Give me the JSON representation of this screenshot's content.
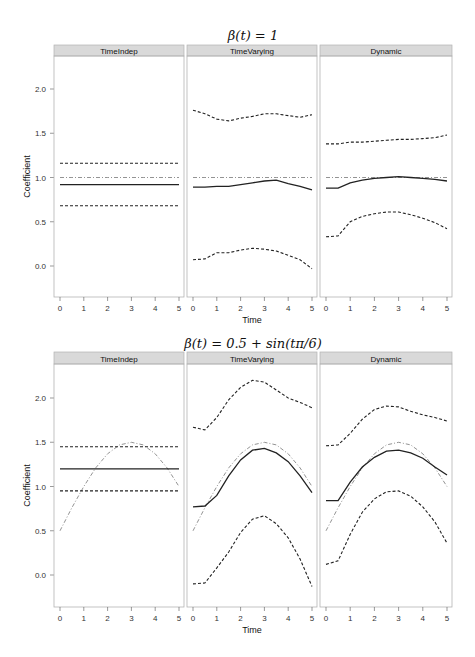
{
  "chart_data": {
    "type": "line",
    "layout": "2 rows x 3 lattice panels (trellis)",
    "xlabel": "Time",
    "ylabel": "Coefficient",
    "xlim": [
      -0.25,
      5.25
    ],
    "ylim": [
      -0.37,
      2.4
    ],
    "x_ticks": [
      0,
      1,
      2,
      3,
      4,
      5
    ],
    "y_ticks": [
      0.0,
      0.5,
      1.0,
      1.5,
      2.0
    ],
    "y_tick_labels": [
      "0.0",
      "0.5",
      "1.0",
      "1.5",
      "2.0"
    ],
    "grid": false,
    "legend": null,
    "line_styles": {
      "estimate": "solid black",
      "ci_lower": "dashed black",
      "ci_upper": "dashed black",
      "true_beta": "dot-dash gray"
    },
    "panel_names": [
      "TimeIndep",
      "TimeVarying",
      "Dynamic"
    ],
    "rows": [
      {
        "title": "β(t) = 1",
        "x": [
          0,
          0.5,
          1,
          1.5,
          2,
          2.5,
          3,
          3.5,
          4,
          4.5,
          5
        ],
        "panels": [
          {
            "name": "TimeIndep",
            "true_beta": [
              1,
              1,
              1,
              1,
              1,
              1,
              1,
              1,
              1,
              1,
              1
            ],
            "estimate": [
              0.92,
              0.92,
              0.92,
              0.92,
              0.92,
              0.92,
              0.92,
              0.92,
              0.92,
              0.92,
              0.92
            ],
            "ci_lower": [
              0.68,
              0.68,
              0.68,
              0.68,
              0.68,
              0.68,
              0.68,
              0.68,
              0.68,
              0.68,
              0.68
            ],
            "ci_upper": [
              1.16,
              1.16,
              1.16,
              1.16,
              1.16,
              1.16,
              1.16,
              1.16,
              1.16,
              1.16,
              1.16
            ]
          },
          {
            "name": "TimeVarying",
            "true_beta": [
              1,
              1,
              1,
              1,
              1,
              1,
              1,
              1,
              1,
              1,
              1
            ],
            "estimate": [
              0.89,
              0.89,
              0.9,
              0.9,
              0.92,
              0.94,
              0.96,
              0.97,
              0.93,
              0.9,
              0.86
            ],
            "ci_lower": [
              0.07,
              0.08,
              0.15,
              0.15,
              0.18,
              0.2,
              0.19,
              0.17,
              0.12,
              0.07,
              -0.03
            ],
            "ci_upper": [
              1.76,
              1.72,
              1.66,
              1.64,
              1.67,
              1.69,
              1.72,
              1.72,
              1.7,
              1.68,
              1.71
            ]
          },
          {
            "name": "Dynamic",
            "true_beta": [
              1,
              1,
              1,
              1,
              1,
              1,
              1,
              1,
              1,
              1,
              1
            ],
            "estimate": [
              0.88,
              0.88,
              0.94,
              0.97,
              0.99,
              1.0,
              1.01,
              1.0,
              0.99,
              0.98,
              0.96
            ],
            "ci_lower": [
              0.33,
              0.34,
              0.5,
              0.56,
              0.59,
              0.61,
              0.61,
              0.58,
              0.54,
              0.49,
              0.42
            ],
            "ci_upper": [
              1.38,
              1.38,
              1.4,
              1.4,
              1.41,
              1.42,
              1.43,
              1.43,
              1.44,
              1.45,
              1.48
            ]
          }
        ]
      },
      {
        "title": "β(t) = 0.5 + sin(tπ/6)",
        "x": [
          0,
          0.5,
          1,
          1.5,
          2,
          2.5,
          3,
          3.5,
          4,
          4.5,
          5
        ],
        "panels": [
          {
            "name": "TimeIndep",
            "true_beta": [
              0.5,
              0.76,
              1.0,
              1.21,
              1.37,
              1.47,
              1.5,
              1.47,
              1.37,
              1.21,
              1.0
            ],
            "estimate": [
              1.2,
              1.2,
              1.2,
              1.2,
              1.2,
              1.2,
              1.2,
              1.2,
              1.2,
              1.2,
              1.2
            ],
            "ci_lower": [
              0.95,
              0.95,
              0.95,
              0.95,
              0.95,
              0.95,
              0.95,
              0.95,
              0.95,
              0.95,
              0.95
            ],
            "ci_upper": [
              1.45,
              1.45,
              1.45,
              1.45,
              1.45,
              1.45,
              1.45,
              1.45,
              1.45,
              1.45,
              1.45
            ]
          },
          {
            "name": "TimeVarying",
            "true_beta": [
              0.5,
              0.76,
              1.0,
              1.21,
              1.37,
              1.47,
              1.5,
              1.47,
              1.37,
              1.21,
              1.0
            ],
            "estimate": [
              0.77,
              0.78,
              0.9,
              1.12,
              1.3,
              1.41,
              1.43,
              1.38,
              1.28,
              1.12,
              0.93
            ],
            "ci_lower": [
              -0.1,
              -0.09,
              0.08,
              0.26,
              0.48,
              0.63,
              0.67,
              0.58,
              0.42,
              0.18,
              -0.13
            ],
            "ci_upper": [
              1.67,
              1.64,
              1.78,
              1.98,
              2.12,
              2.2,
              2.18,
              2.09,
              2.0,
              1.95,
              1.89
            ]
          },
          {
            "name": "Dynamic",
            "true_beta": [
              0.5,
              0.76,
              1.0,
              1.21,
              1.37,
              1.47,
              1.5,
              1.47,
              1.37,
              1.21,
              1.0
            ],
            "estimate": [
              0.84,
              0.84,
              1.05,
              1.22,
              1.33,
              1.4,
              1.41,
              1.38,
              1.32,
              1.22,
              1.13
            ],
            "ci_lower": [
              0.12,
              0.16,
              0.46,
              0.71,
              0.86,
              0.94,
              0.95,
              0.89,
              0.77,
              0.6,
              0.36
            ],
            "ci_upper": [
              1.46,
              1.47,
              1.6,
              1.76,
              1.87,
              1.91,
              1.9,
              1.85,
              1.81,
              1.78,
              1.74
            ]
          }
        ]
      }
    ]
  },
  "style": {
    "strip_bg": "#d9d9d9",
    "strip_border": "#b3b3b3",
    "panel_border": "#b3b3b3",
    "estimate_color": "#222222",
    "ci_color": "#222222",
    "true_color": "#777777"
  }
}
